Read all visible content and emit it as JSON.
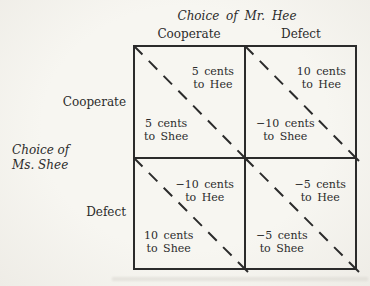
{
  "colors": {
    "background": "#f5f4ef",
    "ink": "#2b2b2b"
  },
  "titles": {
    "column_player": "Choice of Mr. Hee",
    "row_player_line1": "Choice of",
    "row_player_line2": "Ms. Shee"
  },
  "columns": {
    "left": "Cooperate",
    "right": "Defect"
  },
  "rows": {
    "top": "Cooperate",
    "bottom": "Defect"
  },
  "cells": {
    "top_left": {
      "hee_amount": "5 cents",
      "hee_to": "to Hee",
      "shee_amount": "5 cents",
      "shee_to": "to Shee"
    },
    "top_right": {
      "hee_amount": "10 cents",
      "hee_to": "to Hee",
      "shee_amount": "−10 cents",
      "shee_to": "to Shee"
    },
    "bottom_left": {
      "hee_amount": "−10 cents",
      "hee_to": "to Hee",
      "shee_amount": "10 cents",
      "shee_to": "to Shee"
    },
    "bottom_right": {
      "hee_amount": "−5 cents",
      "hee_to": "to Hee",
      "shee_amount": "−5 cents",
      "shee_to": "to Shee"
    }
  }
}
